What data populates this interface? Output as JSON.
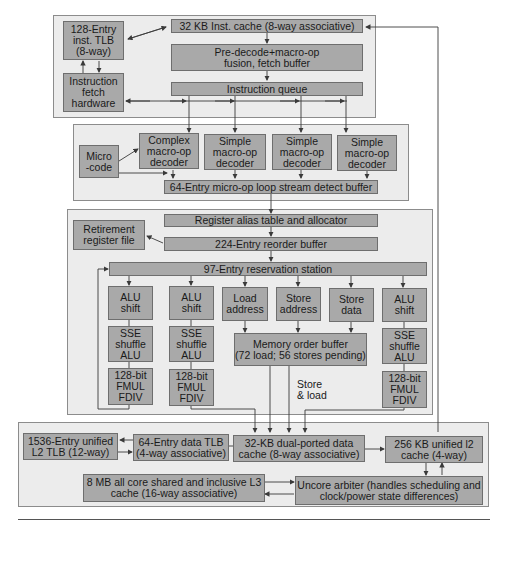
{
  "diagram": {
    "fetch_stage": {
      "inst_tlb": "128-Entry\ninst. TLB\n(8-way)",
      "inst_cache": "32 KB Inst. cache (8-way associative)",
      "predecode": "Pre-decode+macro-op\nfusion, fetch buffer",
      "fetch_hw": "Instruction\nfetch\nhardware",
      "inst_queue": "Instruction queue"
    },
    "decode_stage": {
      "microcode": "Micro\n-code",
      "decoders": [
        "Complex\nmacro-op\ndecoder",
        "Simple\nmacro-op\ndecoder",
        "Simple\nmacro-op\ndecoder",
        "Simple\nmacro-op\ndecoder"
      ],
      "loop_buffer": "64-Entry micro-op loop stream detect buffer"
    },
    "execute_stage": {
      "rat": "Register alias table and allocator",
      "retirement": "Retirement\nregister file",
      "rob": "224-Entry reorder buffer",
      "rs": "97-Entry reservation station",
      "units": [
        "ALU\nshift",
        "ALU\nshift",
        "Load\naddress",
        "Store\naddress",
        "Store\ndata",
        "ALU\nshift"
      ],
      "sse": [
        "SSE\nshuffle\nALU",
        "SSE\nshuffle\nALU",
        "SSE\nshuffle\nALU"
      ],
      "fmul": [
        "128-bit\nFMUL\nFDIV",
        "128-bit\nFMUL\nFDIV",
        "128-bit\nFMUL\nFDIV"
      ],
      "mob": "Memory order buffer\n(72 load; 56 stores pending)",
      "store_load_label": "Store\n& load"
    },
    "memory_stage": {
      "l2_tlb": "1536-Entry unified\nL2 TLB (12-way)",
      "data_tlb": "64-Entry data TLB\n(4-way associative)",
      "data_cache": "32-KB dual-ported data\ncache (8-way associative)",
      "l2_cache": "256 KB unified l2\ncache (4-way)",
      "l3_cache": "8 MB all core shared and inclusive L3\ncache (16-way associative)",
      "uncore": "Uncore arbiter (handles scheduling and\nclock/power state differences)"
    },
    "colors": {
      "box_fill": "#a9a9a9",
      "box_border": "#6e6e6e",
      "panel_fill": "#ececec",
      "panel_border": "#8c8c8c",
      "wire": "#3a3a3a"
    }
  }
}
